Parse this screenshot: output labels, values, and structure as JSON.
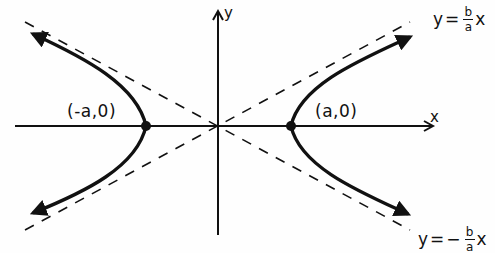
{
  "diagram": {
    "type": "hyperbola",
    "axes": {
      "x_label": "x",
      "y_label": "y"
    },
    "vertices": [
      {
        "label": "(-a,0)",
        "x": 146,
        "y": 126
      },
      {
        "label": "(a,0)",
        "x": 291,
        "y": 126
      }
    ],
    "asymptotes": [
      {
        "label_lhs": "y",
        "label_eq": "=",
        "label_sign": "",
        "frac_num": "b",
        "frac_den": "a",
        "label_var": "x",
        "position": "upper-right"
      },
      {
        "label_lhs": "y",
        "label_eq": "=",
        "label_sign": "−",
        "frac_num": "b",
        "frac_den": "a",
        "label_var": "x",
        "position": "lower-right"
      }
    ],
    "center": {
      "x": 218,
      "y": 126
    },
    "colors": {
      "ink": "#111111",
      "background": "#fefefe"
    }
  }
}
